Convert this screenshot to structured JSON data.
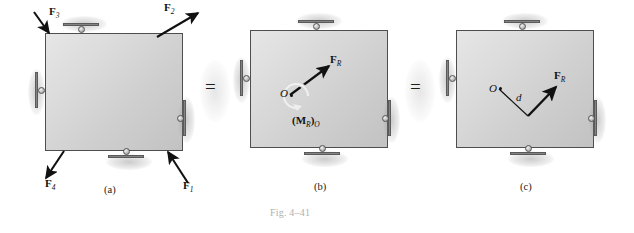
{
  "figure": {
    "caption": "Fig. 4–41",
    "equals_1": "=",
    "equals_2": "="
  },
  "panels": [
    {
      "id": "a",
      "sublabel": "(a)",
      "description": "Rigid plate with four applied forces and four roller supports",
      "forces": [
        {
          "name": "F3",
          "label_base": "F",
          "label_sub": "3",
          "direction": "down-right",
          "location": "top-left-corner"
        },
        {
          "name": "F2",
          "label_base": "F",
          "label_sub": "2",
          "direction": "up-right",
          "location": "top-right-corner"
        },
        {
          "name": "F4",
          "label_base": "F",
          "label_sub": "4",
          "direction": "down-left",
          "location": "bottom-left-corner"
        },
        {
          "name": "F1",
          "label_base": "F",
          "label_sub": "1",
          "direction": "up-left",
          "location": "bottom-right-corner"
        }
      ],
      "supports": [
        "top-roller",
        "left-roller",
        "right-roller",
        "bottom-roller"
      ]
    },
    {
      "id": "b",
      "sublabel": "(b)",
      "description": "Equivalent resultant force at point O plus resultant couple moment",
      "point_label": "O",
      "forces": [
        {
          "name": "FR",
          "label_base": "F",
          "label_sub": "R",
          "direction": "up-right",
          "location": "from-point-O"
        }
      ],
      "moment": {
        "name": "MR_O",
        "label_open": "(",
        "label_base": "M",
        "label_sub": "R",
        "label_close": ")",
        "label_sub2": "O",
        "sense": "counterclockwise"
      },
      "supports": [
        "top-roller",
        "left-roller",
        "right-roller",
        "bottom-roller"
      ]
    },
    {
      "id": "c",
      "sublabel": "(c)",
      "description": "Single resultant force acting at perpendicular distance d from point O",
      "point_label": "O",
      "distance_label": "d",
      "forces": [
        {
          "name": "FR",
          "label_base": "F",
          "label_sub": "R",
          "direction": "up-right",
          "location": "offset-from-O"
        }
      ],
      "supports": [
        "top-roller",
        "left-roller",
        "right-roller",
        "bottom-roller"
      ]
    }
  ],
  "colors": {
    "body_fill_light": "#e6e6e6",
    "body_fill_dark": "#c2c2c2",
    "body_border": "#4e4e4e",
    "vector_color": "#111111",
    "caption_color": "#b0b0b0"
  }
}
